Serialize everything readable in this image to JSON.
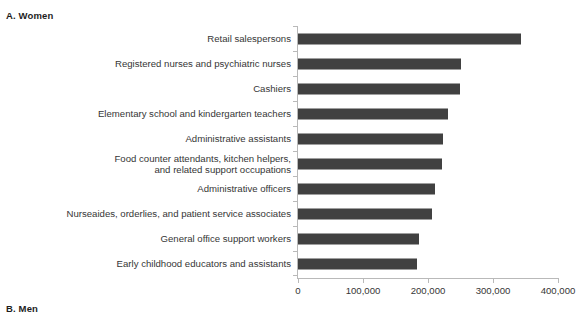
{
  "panels": {
    "a": {
      "label": "A. Women"
    },
    "b": {
      "label": "B. Men"
    }
  },
  "chart_data": {
    "type": "bar",
    "orientation": "horizontal",
    "title": "A. Women",
    "xlabel": "",
    "ylabel": "",
    "xlim": [
      0,
      400000
    ],
    "grid": false,
    "legend": null,
    "bar_color": "#414141",
    "axis_color": "#b9b9b9",
    "xticks": [
      0,
      100000,
      200000,
      300000,
      400000
    ],
    "xticklabels": [
      "0",
      "100,000",
      "200,000",
      "300,000",
      "400,000"
    ],
    "categories": [
      "Retail salespersons",
      "Registered nurses and psychiatric nurses",
      "Cashiers",
      "Elementary school and kindergarten teachers",
      "Administrative assistants",
      "Food counter attendants, kitchen helpers,\nand related support occupations",
      "Administrative officers",
      "Nurseaides, orderlies, and patient service associates",
      "General office support workers",
      "Early childhood educators and assistants"
    ],
    "values": [
      343000,
      251000,
      249000,
      231000,
      223000,
      222000,
      211000,
      206000,
      186000,
      183000
    ]
  }
}
